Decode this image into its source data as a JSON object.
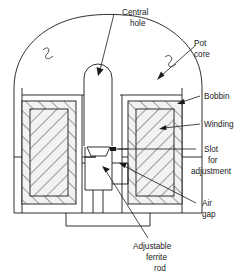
{
  "figure": {
    "background_color": "#ffffff",
    "line_color": "#1a1a1a",
    "width": 248,
    "height": 274
  },
  "labels": {
    "central_hole": {
      "line1": "Central",
      "line2": "hole"
    },
    "pot_core": {
      "line1": "Pot",
      "line2": "core"
    },
    "bobbin": {
      "line1": "Bobbin"
    },
    "winding": {
      "line1": "Winding"
    },
    "slot_for_adjustment": {
      "line1": "Slot",
      "line2": "for",
      "line3": "adjustment"
    },
    "air_gap": {
      "line1": "Air",
      "line2": "gap"
    },
    "adjustable_ferrite_rod": {
      "line1": "Adjustable",
      "line2": "ferrite",
      "line3": "rod"
    }
  }
}
